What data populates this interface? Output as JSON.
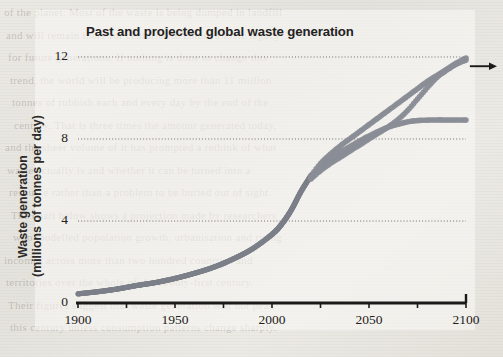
{
  "document": {
    "type": "scanned-book-page",
    "background_note": "figure printed over faint body text"
  },
  "figure": {
    "title": "Past and projected global waste generation",
    "ylabel_line1": "Waste generation",
    "ylabel_line2": "(millions of tonnes per day)",
    "arrow_name": "continues-upward-arrow"
  },
  "colors": {
    "curve": "#8a8d96",
    "curve_dark": "#7c7f89",
    "axis": "#1b1a19",
    "grid": "#5d5b58",
    "text": "#232120",
    "paper": "#e9e7e2"
  },
  "chart_data": {
    "type": "line",
    "title": "Past and projected global waste generation",
    "xlabel": "",
    "ylabel": "Waste generation (millions of tonnes per day)",
    "xlim": [
      1900,
      2100
    ],
    "ylim": [
      0,
      12
    ],
    "xticks": [
      1900,
      1950,
      2000,
      2050,
      2100
    ],
    "xticks_minor": [
      1925,
      1975,
      2025,
      2075
    ],
    "yticks": [
      0,
      4,
      8,
      12
    ],
    "grid": "horizontal-dotted",
    "legend": "none",
    "marker": "round-dots",
    "annotations": [
      {
        "name": "arrow",
        "text": "",
        "x": 2100,
        "y": 11.7,
        "direction": "right"
      }
    ],
    "series": [
      {
        "name": "historical",
        "x": [
          1900,
          1910,
          1920,
          1930,
          1940,
          1950,
          1960,
          1970,
          1980,
          1990,
          2000,
          2005,
          2010,
          2015,
          2020
        ],
        "values": [
          0.45,
          0.55,
          0.68,
          0.85,
          1.0,
          1.2,
          1.45,
          1.75,
          2.15,
          2.65,
          3.35,
          3.85,
          4.55,
          5.45,
          6.2
        ]
      },
      {
        "name": "projection-upper",
        "x": [
          2020,
          2025,
          2030,
          2035,
          2040,
          2045,
          2050,
          2055,
          2060,
          2065,
          2070,
          2075,
          2080,
          2085,
          2090,
          2095,
          2100
        ],
        "values": [
          6.2,
          6.8,
          7.25,
          7.65,
          8.0,
          8.35,
          8.7,
          9.05,
          9.4,
          9.75,
          10.1,
          10.45,
          10.8,
          11.1,
          11.4,
          11.7,
          11.95
        ]
      },
      {
        "name": "projection-middle",
        "x": [
          2020,
          2025,
          2030,
          2035,
          2040,
          2045,
          2050,
          2055,
          2060,
          2065,
          2070,
          2075,
          2080,
          2085,
          2090,
          2095,
          2100
        ],
        "values": [
          6.05,
          6.45,
          6.8,
          7.1,
          7.4,
          7.7,
          8.0,
          8.3,
          8.6,
          8.95,
          9.4,
          9.95,
          10.5,
          11.0,
          11.35,
          11.65,
          11.85
        ]
      },
      {
        "name": "projection-plateau",
        "x": [
          2020,
          2025,
          2030,
          2035,
          2040,
          2045,
          2050,
          2055,
          2060,
          2065,
          2070,
          2075,
          2080,
          2085,
          2090,
          2095,
          2100
        ],
        "values": [
          6.15,
          6.6,
          7.0,
          7.35,
          7.62,
          7.9,
          8.15,
          8.38,
          8.58,
          8.72,
          8.84,
          8.9,
          8.92,
          8.93,
          8.93,
          8.93,
          8.93
        ]
      }
    ]
  },
  "ghost_lines": [
    "of the planet. Most of the waste is being dumped in landfill",
    "and will remain there for centuries to come, a toxic legacy",
    "for future generations. If nothing is done to change this",
    "trend, the world will be producing more than 11 million",
    "tonnes of rubbish each and every day by the end of the",
    "century. That is three times the amount generated today,",
    "and the sheer volume of it has prompted a rethink of what",
    "waste actually is and whether it can be turned into a",
    "resource rather than a problem to be buried out of sight.",
    "The chart below shows a projection made by researchers",
    "who modelled population growth, urbanisation and rising",
    "incomes across more than two hundred countries and",
    "territories over the whole of the twenty-first century.",
    "Their figures suggest that waste generation will not peak",
    "this century unless consumption patterns change sharply."
  ]
}
